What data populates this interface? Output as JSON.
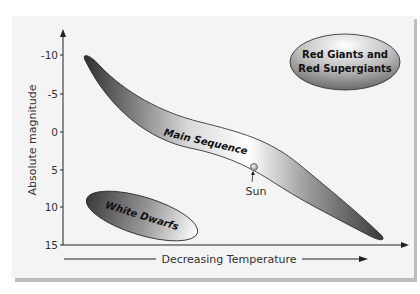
{
  "diagram": {
    "type": "Hertzsprung-Russell diagram",
    "y_axis": {
      "title": "Absolute magnitude",
      "ticks": [
        "-10",
        "-5",
        "0",
        "5",
        "10",
        "15"
      ]
    },
    "x_axis": {
      "title": "Decreasing Temperature"
    },
    "regions": {
      "main_sequence": "Main Sequence",
      "red_giants_line1": "Red Giants and",
      "red_giants_line2": "Red Supergiants",
      "white_dwarfs": "White Dwarfs"
    },
    "markers": {
      "sun": "Sun"
    },
    "colors": {
      "background": "#f4f4f4",
      "frame_shadow": "#bdbdbd",
      "dark_fill": "#3a3a3a",
      "light_fill": "#ffffff",
      "sun_fill": "#c8c8c8",
      "axis": "#222222"
    }
  }
}
